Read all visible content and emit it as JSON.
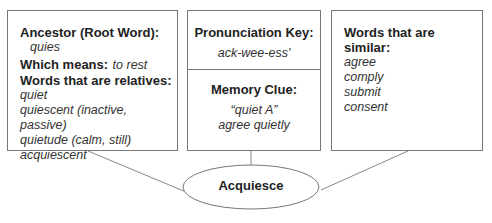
{
  "diagram": {
    "center": {
      "label": "Acquiesce"
    },
    "left_box": {
      "ancestor_heading": "Ancestor (Root Word):",
      "ancestor_value": "quies",
      "means_heading": "Which means:",
      "means_value": "to rest",
      "relatives_heading": "Words that are relatives:",
      "relatives": [
        "quiet",
        "quiescent (inactive, passive)",
        "quietude (calm, still)",
        "acquiescent"
      ]
    },
    "middle_box": {
      "pronunciation_heading": "Pronunciation Key:",
      "pronunciation_value": "ack-wee-ess'",
      "memory_heading": "Memory Clue:",
      "memory_lines": [
        "“quiet A”",
        "agree quietly"
      ]
    },
    "right_box": {
      "similar_heading": "Words that are similar:",
      "similar": [
        "agree",
        "comply",
        "submit",
        "consent"
      ]
    },
    "colors": {
      "line": "#777777",
      "text": "#222222"
    }
  }
}
